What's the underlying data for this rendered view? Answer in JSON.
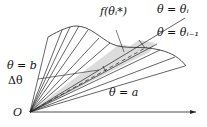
{
  "diagram": {
    "labels": {
      "f_theta": "f(θᵢ*)",
      "theta_i": "θ = θᵢ",
      "theta_i_minus_1": "θ = θᵢ₋₁",
      "theta_b": "θ = b",
      "delta_theta": "Δθ",
      "theta_a": "θ = a",
      "origin": "O"
    },
    "colors": {
      "line": "#222222",
      "shaded_sector": "#dcdcdc"
    }
  }
}
